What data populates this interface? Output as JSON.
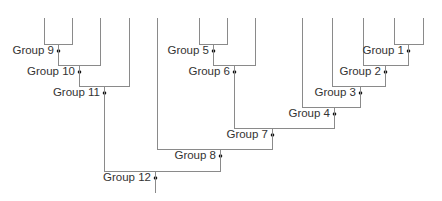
{
  "diagram": {
    "type": "dendrogram",
    "colors": {
      "line": "#8a8a8a",
      "node": "#111111",
      "text": "#333333",
      "background": "#ffffff"
    },
    "leaf_top_y": 17,
    "leaves": [
      {
        "id": "L1",
        "x": 44
      },
      {
        "id": "L2",
        "x": 72
      },
      {
        "id": "L3",
        "x": 100
      },
      {
        "id": "L4",
        "x": 129
      },
      {
        "id": "L5",
        "x": 157
      },
      {
        "id": "L6",
        "x": 199
      },
      {
        "id": "L7",
        "x": 227
      },
      {
        "id": "L8",
        "x": 255
      },
      {
        "id": "L9",
        "x": 302
      },
      {
        "id": "L10",
        "x": 332
      },
      {
        "id": "L11",
        "x": 363
      },
      {
        "id": "L12",
        "x": 394
      },
      {
        "id": "L13",
        "x": 423
      }
    ],
    "groups": [
      {
        "label": "Group 1",
        "left": "L12",
        "right": "L13",
        "join_y": 44,
        "x": 408
      },
      {
        "label": "Group 2",
        "left": "L11",
        "right": "Group 1",
        "join_y": 65,
        "x": 385
      },
      {
        "label": "Group 3",
        "left": "L10",
        "right": "Group 2",
        "join_y": 86,
        "x": 360
      },
      {
        "label": "Group 4",
        "left": "L9",
        "right": "Group 3",
        "join_y": 107,
        "x": 334
      },
      {
        "label": "Group 5",
        "left": "L6",
        "right": "L7",
        "join_y": 44,
        "x": 213
      },
      {
        "label": "Group 6",
        "left": "Group 5",
        "right": "L8",
        "join_y": 65,
        "x": 234
      },
      {
        "label": "Group 7",
        "left": "Group 6",
        "right": "Group 4",
        "join_y": 128,
        "x": 272
      },
      {
        "label": "Group 8",
        "left": "L5",
        "right": "Group 7",
        "join_y": 149,
        "x": 220
      },
      {
        "label": "Group 9",
        "left": "L1",
        "right": "L2",
        "join_y": 44,
        "x": 58
      },
      {
        "label": "Group 10",
        "left": "Group 9",
        "right": "L3",
        "join_y": 65,
        "x": 79
      },
      {
        "label": "Group 11",
        "left": "Group 10",
        "right": "L4",
        "join_y": 86,
        "x": 104
      },
      {
        "label": "Group 12",
        "left": "Group 11",
        "right": "Group 8",
        "join_y": 171,
        "x": 155
      }
    ],
    "root_end_y": 192
  }
}
